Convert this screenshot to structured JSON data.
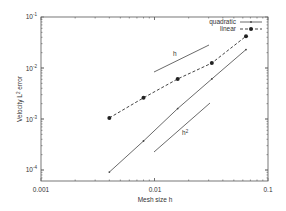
{
  "chart_data": {
    "type": "line",
    "title": "",
    "xlabel": "Mesh size h",
    "ylabel": "Velocity L² error",
    "xscale": "log",
    "yscale": "log",
    "xlim": [
      0.001,
      0.1
    ],
    "ylim": [
      5e-05,
      0.1
    ],
    "x_ticks": [
      "0.001",
      "0.01",
      "0.1"
    ],
    "y_ticks": [
      {
        "base": "10",
        "exp": "-1"
      },
      {
        "base": "10",
        "exp": "-2"
      },
      {
        "base": "10",
        "exp": "-3"
      },
      {
        "base": "10",
        "exp": "-4"
      }
    ],
    "grid": false,
    "legend_position": "upper right",
    "x": [
      0.004,
      0.008,
      0.016,
      0.032,
      0.064
    ],
    "series": [
      {
        "name": "quadratic",
        "style": "solid",
        "marker": "small-dot",
        "values": [
          9.1e-05,
          0.00037,
          0.0016,
          0.0061,
          0.023
        ]
      },
      {
        "name": "linear",
        "style": "dashed",
        "marker": "filled-circle",
        "values": [
          0.00105,
          0.0026,
          0.0061,
          0.0125,
          0.042
        ]
      }
    ],
    "annotations": [
      {
        "text": "h",
        "type": "reference-slope",
        "slope": 1
      },
      {
        "text": "h²",
        "type": "reference-slope",
        "slope": 2
      }
    ]
  },
  "labels": {
    "xlabel": "Mesh size h",
    "ylabel_pre": "Velocity L",
    "ylabel_sup": "2",
    "ylabel_post": " error",
    "xticks": [
      "0.001",
      "0.01",
      "0.1"
    ],
    "yticks": [
      "-1",
      "-2",
      "-3",
      "-4"
    ],
    "ytick_base": "10",
    "legend": [
      "quadratic",
      "linear"
    ],
    "ref_h": "h",
    "ref_h2_base": "h",
    "ref_h2_sup": "2"
  },
  "colors": {
    "axis": "#555555",
    "line": "#444444",
    "text": "#333333"
  }
}
